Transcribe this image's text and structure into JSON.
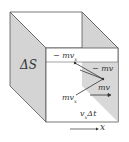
{
  "diagram": {
    "area_label": "ΔS",
    "momentum_labels": {
      "top_left": "− mv",
      "top_left_sub": "x",
      "right_upper": "− mv",
      "right_lower": "mv",
      "bottom_left": "mv",
      "bottom_left_sub": "x"
    },
    "length_label_v": "v",
    "length_label_sub": "x",
    "length_label_rest": "Δt",
    "axis_label": "x"
  },
  "colors": {
    "face_shaded": "#d4d4d4",
    "edges": "#555555",
    "background": "#ffffff"
  }
}
